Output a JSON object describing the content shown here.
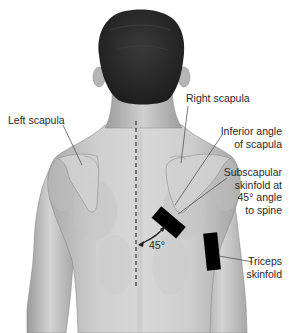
{
  "figure": {
    "colors": {
      "background": "#ffffff",
      "skin_light": "#dcdcdc",
      "skin_mid": "#bdbdbd",
      "skin_shadow": "#8f8f8f",
      "hair": "#2b2b2b",
      "marker": "#000000",
      "text": "#2a2a2a",
      "leader_line": "#444444"
    }
  },
  "labels": {
    "left_scapula": "Left scapula",
    "right_scapula": "Right scapula",
    "inferior_angle": [
      "Inferior angle",
      "of scapula"
    ],
    "subscapular": [
      "Subscapular",
      "skinfold at",
      "45° angle",
      "to spine"
    ],
    "triceps": [
      "Triceps",
      "skinfold"
    ],
    "angle": "45°"
  },
  "markers": {
    "subscapular_site": {
      "angle_to_spine_deg": 45
    },
    "triceps_site": {
      "orientation": "vertical"
    },
    "spine_line": {
      "style": "dashed"
    }
  }
}
